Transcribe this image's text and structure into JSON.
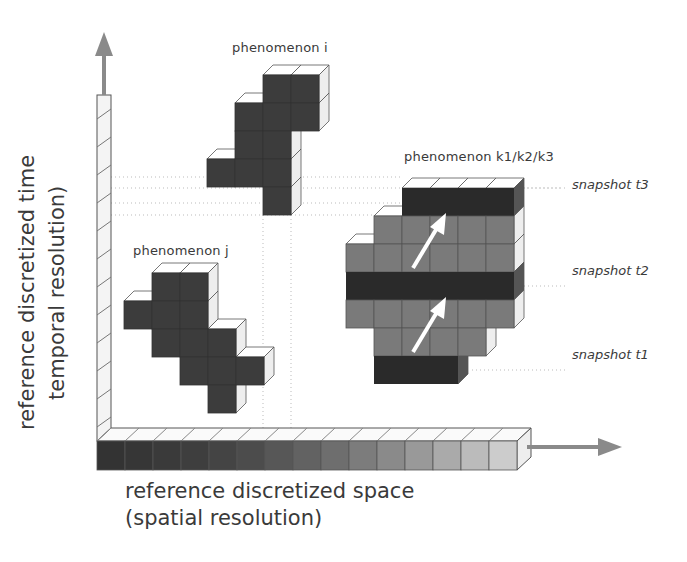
{
  "figure": {
    "cell_size": 28,
    "colors": {
      "dark": "#3c3c3c",
      "band": "#2a2a2a",
      "gray": "#7a7a7a",
      "top_face": "#ffffff",
      "side_face": "#eeeeee",
      "edge": "#555555",
      "arrow": "#8a8a8a",
      "guide": "#bbbbbb"
    }
  },
  "axes": {
    "time_label_line1": "reference discretized time",
    "time_label_line2": "temporal resolution)",
    "space_label_line1": "reference discretized space",
    "space_label_line2": "(spatial resolution)",
    "space_bar_cells": 15,
    "space_bar_gradient": [
      "#333333",
      "#363636",
      "#3a3a3a",
      "#3e3e3e",
      "#444444",
      "#4c4c4c",
      "#575757",
      "#626262",
      "#6e6e6e",
      "#7c7c7c",
      "#8a8a8a",
      "#999999",
      "#aaaaaa",
      "#bbbbbb",
      "#cccccc"
    ]
  },
  "phenomena": [
    {
      "name": "phenomenon i",
      "label": "phenomenon i",
      "origin": [
        207,
        75
      ],
      "rows": [
        {
          "cols": [
            2,
            3
          ],
          "fill": "dark"
        },
        {
          "cols": [
            1,
            2,
            3
          ],
          "fill": "dark"
        },
        {
          "cols": [
            1,
            2
          ],
          "fill": "dark"
        },
        {
          "cols": [
            0,
            1,
            2
          ],
          "fill": "dark"
        },
        {
          "cols": [
            2
          ],
          "fill": "dark"
        }
      ]
    },
    {
      "name": "phenomenon j",
      "label": "phenomenon j",
      "origin": [
        124,
        273
      ],
      "rows": [
        {
          "cols": [
            1,
            2
          ],
          "fill": "dark"
        },
        {
          "cols": [
            0,
            1,
            2
          ],
          "fill": "dark"
        },
        {
          "cols": [
            1,
            2,
            3
          ],
          "fill": "dark"
        },
        {
          "cols": [
            2,
            3,
            4
          ],
          "fill": "dark"
        },
        {
          "cols": [
            3
          ],
          "fill": "dark"
        }
      ]
    },
    {
      "name": "phenomenon k",
      "label": "phenomenon k1/k2/k3",
      "origin": [
        346,
        188
      ],
      "rows": [
        {
          "cols": [
            2,
            3,
            4,
            5
          ],
          "fill": "band"
        },
        {
          "cols": [
            1,
            2,
            3,
            4,
            5
          ],
          "fill": "gray"
        },
        {
          "cols": [
            0,
            1,
            2,
            3,
            4,
            5
          ],
          "fill": "gray"
        },
        {
          "cols": [
            0,
            1,
            2,
            3,
            4,
            5
          ],
          "fill": "band"
        },
        {
          "cols": [
            0,
            1,
            2,
            3,
            4,
            5
          ],
          "fill": "gray"
        },
        {
          "cols": [
            1,
            2,
            3,
            4
          ],
          "fill": "gray"
        },
        {
          "cols": [
            1,
            2,
            3
          ],
          "fill": "band"
        }
      ]
    }
  ],
  "snapshots": [
    {
      "label": "snapshot t3",
      "y": 188
    },
    {
      "label": "snapshot t2",
      "y": 272
    },
    {
      "label": "snapshot t1",
      "y": 356
    }
  ]
}
